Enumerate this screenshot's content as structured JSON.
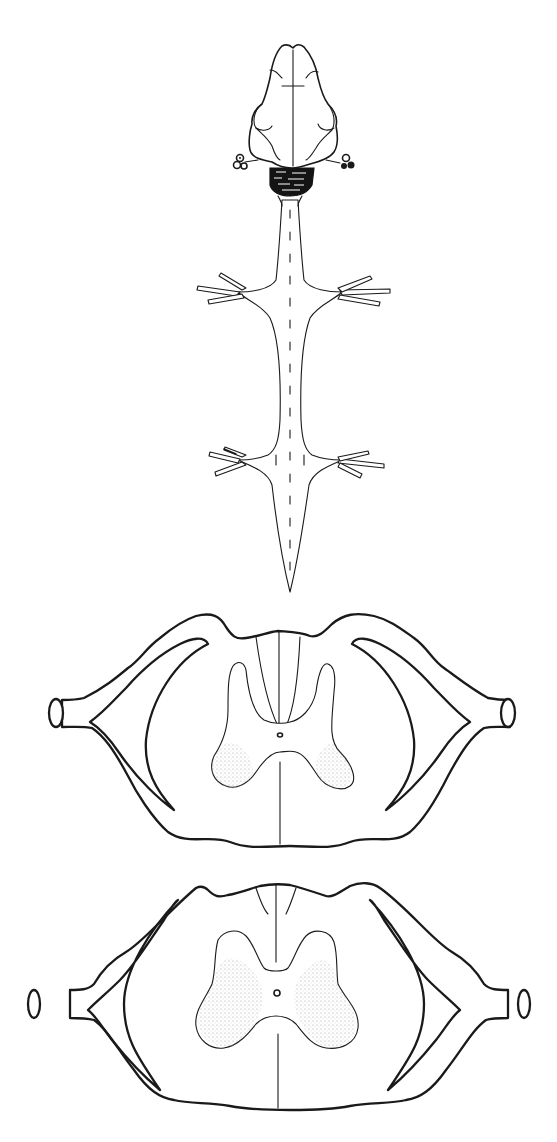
{
  "figure": {
    "panels": [
      {
        "id": "dorsal-view",
        "label": "Brain and spinal cord, dorsal view",
        "parts": [
          "cerebral hemispheres",
          "optic lobes",
          "medulla (shaded)",
          "spinal cord",
          "brachial nerves",
          "lumbar nerves",
          "filum terminale"
        ]
      },
      {
        "id": "section-brachial",
        "label": "Transverse section, brachial enlargement",
        "parts": [
          "dorsal columns",
          "H-shaped gray matter",
          "central canal",
          "stippled ventral horns",
          "dorsal root",
          "dorsal root ganglion",
          "ventral root"
        ]
      },
      {
        "id": "section-lumbar",
        "label": "Transverse section, lumbar enlargement",
        "parts": [
          "dorsal median septum",
          "butterfly gray matter",
          "central canal",
          "stippled ventral horns",
          "dorsal root",
          "dorsal root ganglion",
          "ventral root"
        ]
      }
    ],
    "colors": {
      "ink": "#1a1a1a",
      "background": "#ffffff",
      "stipple": "#9a9a9a"
    }
  }
}
